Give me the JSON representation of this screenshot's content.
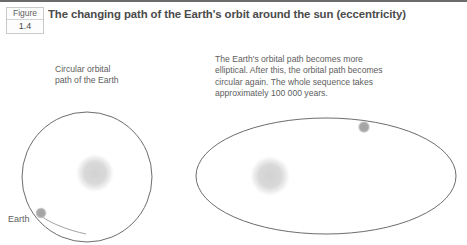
{
  "figure": {
    "badge_word": "Figure",
    "badge_number": "1.4",
    "title": "The changing path of the Earth's orbit around the sun (eccentricity)"
  },
  "captions": {
    "left": "Circular orbital\npath of the Earth",
    "right": "The Earth's orbital path becomes more\nelliptical. After this, the orbital path becomes\ncircular again. The whole sequence takes\napproximately 100 000 years."
  },
  "labels": {
    "earth": "Earth"
  },
  "colors": {
    "title_text": "#4b4b4b",
    "body_text": "#5e5e5e",
    "orbit_stroke": "#5b5b5b",
    "sun_fill": "#d6d6d6",
    "earth_fill": "#a8a8a8",
    "rule": "#6b6b6b",
    "background": "#ffffff"
  },
  "diagram_left": {
    "name": "circular-orbit",
    "orbit_shape": "circle",
    "orbit_center": [
      87,
      177
    ],
    "orbit_radius": 65,
    "sun_center": [
      95,
      173
    ],
    "sun_radius": 17,
    "earth_center": [
      41,
      213
    ],
    "earth_radius": 5.5
  },
  "diagram_right": {
    "name": "elliptical-orbit",
    "orbit_shape": "ellipse",
    "orbit_center": [
      326,
      176
    ],
    "orbit_radius_x": 130,
    "orbit_radius_y": 58,
    "sun_center": [
      270,
      176
    ],
    "sun_radius": 18,
    "earth_center": [
      364,
      127
    ],
    "earth_radius": 6
  }
}
